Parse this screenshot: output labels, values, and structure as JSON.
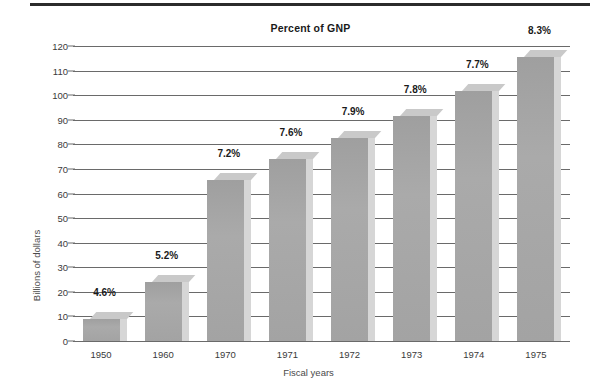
{
  "figure": {
    "title": "Percent of GNP",
    "xaxis_title": "Fiscal years",
    "yaxis_title": "Billions of dollars"
  },
  "colors": {
    "bar_face": "#a6a6a6",
    "bar_top": "#c9c9c9",
    "bar_side": "#d6d6d6",
    "bar_shadow": "#e2e2e2",
    "gridline": "#6a6a6a",
    "text": "#3a3a3a",
    "rule": "#2b2b2b"
  },
  "chart_data": {
    "type": "bar",
    "title": "Percent of GNP",
    "xlabel": "Fiscal years",
    "ylabel": "Billions of dollars",
    "categories": [
      "1950",
      "1960",
      "1970",
      "1971",
      "1972",
      "1973",
      "1974",
      "1975"
    ],
    "values": [
      11.7,
      26.8,
      68.5,
      76.8,
      85.5,
      94.5,
      104.5,
      118.5
    ],
    "data_labels": [
      "4.6%",
      "5.2%",
      "7.2%",
      "7.6%",
      "7.9%",
      "7.8%",
      "7.7%",
      "8.3%"
    ],
    "ylim": [
      0,
      120
    ],
    "yticks": [
      0,
      10,
      20,
      30,
      40,
      50,
      60,
      70,
      80,
      90,
      100,
      110,
      120
    ],
    "ytick_labels": [
      "0",
      "10",
      "20",
      "30",
      "40",
      "50",
      "60",
      "70",
      "80",
      "90",
      "100",
      "110",
      "120"
    ],
    "grid": true,
    "legend": false,
    "series": [
      {
        "name": "Billions of dollars",
        "values": [
          11.7,
          26.8,
          68.5,
          76.8,
          85.5,
          94.5,
          104.5,
          118.5
        ],
        "percent_of_gnp": [
          4.6,
          5.2,
          7.2,
          7.6,
          7.9,
          7.8,
          7.7,
          8.3
        ]
      }
    ]
  }
}
